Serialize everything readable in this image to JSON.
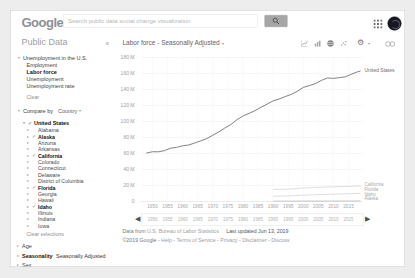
{
  "topbar": {
    "logo": "Google",
    "search": {
      "value": "",
      "placeholder": "Search public data social change visualization"
    }
  },
  "icons": {
    "collapse_sidebar": "«",
    "title_caret": "▾",
    "dropdown_caret": "▾",
    "expander_collapsed": "▸",
    "expander_expanded": "▾",
    "check": "✓",
    "gear": "⚙",
    "gear_caret": "▾",
    "slider_left": "◀",
    "slider_right": "▶"
  },
  "sidebar": {
    "title": "Public Data",
    "dataset": {
      "label": "Unemployment in the U.S.",
      "children": [
        "Employment",
        "Labor force",
        "Unemployment",
        "Unemployment rate"
      ],
      "selected": "Labor force",
      "clear_label": "Clear"
    },
    "compare_by": {
      "label": "Compare by",
      "value": "Country"
    },
    "tree": {
      "root": {
        "label": "United States",
        "checked": true
      },
      "states": [
        {
          "label": "Alabama",
          "checked": false
        },
        {
          "label": "Alaska",
          "checked": true
        },
        {
          "label": "Arizona",
          "checked": false
        },
        {
          "label": "Arkansas",
          "checked": false
        },
        {
          "label": "California",
          "checked": true
        },
        {
          "label": "Colorado",
          "checked": false
        },
        {
          "label": "Connecticut",
          "checked": false
        },
        {
          "label": "Delaware",
          "checked": false
        },
        {
          "label": "District of Columbia",
          "checked": false
        },
        {
          "label": "Florida",
          "checked": true
        },
        {
          "label": "Georgia",
          "checked": false
        },
        {
          "label": "Hawaii",
          "checked": false
        },
        {
          "label": "Idaho",
          "checked": true
        },
        {
          "label": "Illinois",
          "checked": false
        },
        {
          "label": "Indiana",
          "checked": false
        },
        {
          "label": "Iowa",
          "checked": false
        }
      ]
    },
    "clear_selections_label": "Clear selections",
    "filters": [
      {
        "label": "Age",
        "value": ""
      },
      {
        "label": "Seasonality",
        "value": "Seasonally Adjusted"
      },
      {
        "label": "Sex",
        "value": ""
      }
    ]
  },
  "chart": {
    "title": "Labor force - Seasonally Adjusted",
    "toolbar_icons": [
      "line-chart",
      "bar-chart",
      "map",
      "scatter",
      "settings-gear",
      "link"
    ],
    "footer": {
      "data_from_prefix": "Data from",
      "source_link": "U.S. Bureau of Labor Statistics",
      "last_updated": "Last updated Jun 13, 2019",
      "copyright": "©2019 Google",
      "links": [
        "Help",
        "Terms of Service",
        "Privacy",
        "Disclaimer",
        "Discuss"
      ]
    }
  },
  "chart_data": {
    "type": "line",
    "title": "Labor force - Seasonally Adjusted",
    "xlabel": "",
    "ylabel": "",
    "grid": true,
    "legend_position": "right-of-line-ends",
    "ylim_millions": [
      0,
      180
    ],
    "yticks_millions": [
      180,
      160,
      140,
      120,
      100,
      80,
      60,
      40,
      20,
      0
    ],
    "ytick_labels": [
      "180 M",
      "160 M",
      "140 M",
      "120 M",
      "100 M",
      "80 M",
      "60 M",
      "40 M",
      "20 M",
      "0"
    ],
    "xticks": [
      1950,
      1955,
      1960,
      1965,
      1970,
      1975,
      1980,
      1985,
      1990,
      1995,
      2000,
      2005,
      2010,
      2015
    ],
    "series": [
      {
        "name": "United States",
        "color": "#6a6a6a",
        "x": [
          1948,
          1950,
          1952,
          1954,
          1956,
          1958,
          1960,
          1962,
          1964,
          1966,
          1968,
          1970,
          1972,
          1974,
          1976,
          1978,
          1980,
          1982,
          1984,
          1986,
          1988,
          1990,
          1992,
          1994,
          1996,
          1998,
          2000,
          2002,
          2004,
          2006,
          2008,
          2009,
          2010,
          2012,
          2014,
          2016,
          2018,
          2019
        ],
        "values_millions": [
          60.6,
          62.2,
          62.1,
          63.6,
          66.6,
          67.6,
          69.6,
          70.6,
          73.1,
          75.8,
          78.7,
          82.8,
          87.0,
          91.9,
          96.2,
          102.3,
          106.9,
          110.2,
          113.5,
          117.8,
          121.7,
          125.8,
          128.1,
          131.1,
          133.9,
          137.7,
          142.6,
          144.9,
          147.4,
          151.4,
          154.3,
          154.2,
          153.9,
          154.9,
          155.9,
          159.2,
          162.1,
          163.2
        ]
      },
      {
        "name": "California",
        "color": "#c8c8c8",
        "x": [
          1990,
          1995,
          2000,
          2005,
          2010,
          2015,
          2019
        ],
        "values_millions": [
          15.2,
          15.4,
          16.9,
          17.7,
          18.3,
          18.9,
          19.5
        ]
      },
      {
        "name": "Florida",
        "color": "#c8c8c8",
        "x": [
          1990,
          1995,
          2000,
          2005,
          2010,
          2015,
          2019
        ],
        "values_millions": [
          6.5,
          7.0,
          7.8,
          8.6,
          9.2,
          9.6,
          10.3
        ]
      },
      {
        "name": "Idaho",
        "color": "#c8c8c8",
        "x": [
          1990,
          1995,
          2000,
          2005,
          2010,
          2015,
          2019
        ],
        "values_millions": [
          0.5,
          0.58,
          0.67,
          0.73,
          0.77,
          0.82,
          0.89
        ]
      },
      {
        "name": "Alaska",
        "color": "#c8c8c8",
        "x": [
          1990,
          1995,
          2000,
          2005,
          2010,
          2015,
          2019
        ],
        "values_millions": [
          0.26,
          0.3,
          0.32,
          0.34,
          0.36,
          0.36,
          0.35
        ]
      }
    ]
  }
}
